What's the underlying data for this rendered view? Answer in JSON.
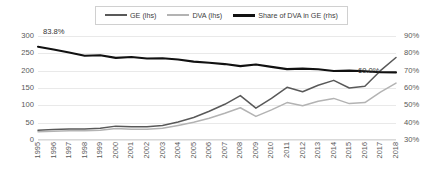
{
  "legend": {
    "position": "top-center",
    "items": [
      {
        "label": "GE (lhs)",
        "color": "#595959",
        "key": "ge"
      },
      {
        "label": "DVA (lhs)",
        "color": "#b3b3b3",
        "key": "dva"
      },
      {
        "label": "Share of DVA in GE (rhs)",
        "color": "#111111",
        "key": "share"
      }
    ]
  },
  "annotations": [
    {
      "name": "share-start-value",
      "text": "83.8%"
    },
    {
      "name": "share-end-value",
      "text": "69.0%"
    }
  ],
  "axes": {
    "left": {
      "ticks": [
        "300",
        "250",
        "200",
        "150",
        "100",
        "50",
        "0"
      ],
      "min": 0,
      "max": 300
    },
    "right": {
      "ticks": [
        "90%",
        "80%",
        "70%",
        "60%",
        "50%",
        "40%",
        "30%"
      ],
      "min": 30,
      "max": 90
    },
    "bottom": {
      "ticks": [
        "1995",
        "1996",
        "1997",
        "1998",
        "1999",
        "2000",
        "2001",
        "2002",
        "2003",
        "2004",
        "2005",
        "2006",
        "2007",
        "2008",
        "2009",
        "2010",
        "2011",
        "2012",
        "2013",
        "2014",
        "2015",
        "2016",
        "2017",
        "2018"
      ]
    }
  },
  "chart_data": {
    "type": "line",
    "title": "",
    "subtitle": "",
    "xlabel": "",
    "ylabel": "",
    "ylim": [
      0,
      300
    ],
    "y2lim": [
      30,
      90
    ],
    "grid": true,
    "legend_position": "top-center",
    "x": [
      "1995",
      "1996",
      "1997",
      "1998",
      "1999",
      "2000",
      "2001",
      "2002",
      "2003",
      "2004",
      "2005",
      "2006",
      "2007",
      "2008",
      "2009",
      "2010",
      "2011",
      "2012",
      "2013",
      "2014",
      "2015",
      "2016",
      "2017",
      "2018"
    ],
    "series": [
      {
        "name": "GE (lhs)",
        "axis": "left",
        "color": "#595959",
        "values": [
          28,
          30,
          32,
          32,
          34,
          40,
          38,
          38,
          42,
          52,
          65,
          83,
          103,
          128,
          92,
          120,
          152,
          139,
          158,
          172,
          150,
          155,
          200,
          238
        ]
      },
      {
        "name": "DVA (lhs)",
        "axis": "left",
        "color": "#b3b3b3",
        "values": [
          24,
          25,
          27,
          27,
          28,
          33,
          31,
          31,
          34,
          42,
          51,
          63,
          77,
          93,
          68,
          87,
          108,
          99,
          112,
          120,
          105,
          108,
          138,
          164
        ]
      },
      {
        "name": "Share of DVA in GE (rhs)",
        "axis": "right",
        "color": "#111111",
        "values": [
          83.8,
          82.2,
          80.5,
          78.6,
          78.9,
          77.4,
          77.9,
          77.0,
          77.2,
          76.4,
          75.2,
          74.6,
          73.8,
          72.6,
          73.6,
          72.2,
          70.9,
          71.2,
          70.8,
          69.8,
          70.0,
          69.7,
          69.1,
          69.0
        ]
      }
    ]
  }
}
